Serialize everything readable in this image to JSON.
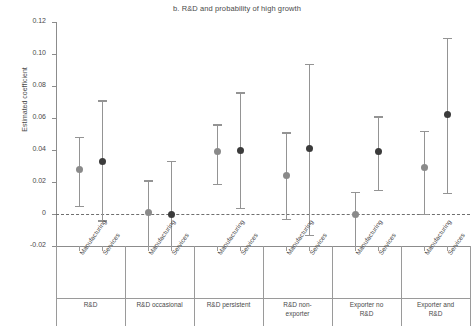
{
  "chart_data": {
    "type": "scatter",
    "title": "b. R&D and probability of high growth",
    "xlabel": "",
    "ylabel": "Estimated coefficient",
    "ylim": [
      -0.02,
      0.12
    ],
    "yticks": [
      "0.12",
      "0.10",
      "0.08",
      "0.06",
      "0.04",
      "0.02",
      "0",
      "-0.02"
    ],
    "ytick_values": [
      0.12,
      0.1,
      0.08,
      0.06,
      0.04,
      0.02,
      0,
      -0.02
    ],
    "grid": false,
    "legend": "none",
    "zero_reference_line": 0,
    "categories": [
      "Manufacturing",
      "Services"
    ],
    "groups": [
      {
        "label": "R&D",
        "label_lines": [
          "R&D"
        ]
      },
      {
        "label": "R&D occasional",
        "label_lines": [
          "R&D occasional"
        ]
      },
      {
        "label": "R&D persistent",
        "label_lines": [
          "R&D persistent"
        ]
      },
      {
        "label": "R&D non-exporter",
        "label_lines": [
          "R&D non-",
          "exporter"
        ]
      },
      {
        "label": "Exporter no R&D",
        "label_lines": [
          "Exporter no",
          "R&D"
        ]
      },
      {
        "label": "Exporter and R&D",
        "label_lines": [
          "Exporter and",
          "R&D"
        ]
      }
    ],
    "points": [
      {
        "group": "R&D",
        "category": "Manufacturing",
        "value": 0.028,
        "ci_low": 0.005,
        "ci_high": 0.048
      },
      {
        "group": "R&D",
        "category": "Services",
        "value": 0.033,
        "ci_low": -0.004,
        "ci_high": 0.071
      },
      {
        "group": "R&D occasional",
        "category": "Manufacturing",
        "value": 0.001,
        "ci_low": -0.026,
        "ci_high": 0.021
      },
      {
        "group": "R&D occasional",
        "category": "Services",
        "value": 0.0,
        "ci_low": -0.033,
        "ci_high": 0.033
      },
      {
        "group": "R&D persistent",
        "category": "Manufacturing",
        "value": 0.039,
        "ci_low": 0.019,
        "ci_high": 0.056
      },
      {
        "group": "R&D persistent",
        "category": "Services",
        "value": 0.04,
        "ci_low": 0.004,
        "ci_high": 0.076
      },
      {
        "group": "R&D non-exporter",
        "category": "Manufacturing",
        "value": 0.024,
        "ci_low": -0.003,
        "ci_high": 0.051
      },
      {
        "group": "R&D non-exporter",
        "category": "Services",
        "value": 0.041,
        "ci_low": -0.013,
        "ci_high": 0.094
      },
      {
        "group": "Exporter no R&D",
        "category": "Manufacturing",
        "value": 0.0,
        "ci_low": -0.026,
        "ci_high": 0.014
      },
      {
        "group": "Exporter no R&D",
        "category": "Services",
        "value": 0.039,
        "ci_low": 0.015,
        "ci_high": 0.061
      },
      {
        "group": "Exporter and R&D",
        "category": "Manufacturing",
        "value": 0.029,
        "ci_low": 0.0,
        "ci_high": 0.052
      },
      {
        "group": "Exporter and R&D",
        "category": "Services",
        "value": 0.062,
        "ci_low": 0.013,
        "ci_high": 0.11
      }
    ],
    "marker_colors": [
      "#8a8a8a",
      "#3b3b3b",
      "#8a8a8a",
      "#3b3b3b",
      "#8a8a8a",
      "#3b3b3b",
      "#8a8a8a",
      "#3b3b3b",
      "#8a8a8a",
      "#3b3b3b",
      "#8a8a8a",
      "#3b3b3b"
    ],
    "whisker_color": "#949494"
  }
}
